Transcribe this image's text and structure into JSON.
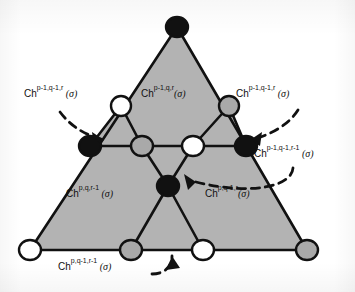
{
  "figure": {
    "colors": {
      "face_fill": "#b3b3b3",
      "line": "#111111",
      "vertex_black": "#111111",
      "vertex_white": "#ffffff",
      "vertex_gray": "#a9a9a9",
      "background": "#ffffff",
      "arrow": "#111111"
    },
    "labels": [
      {
        "id": "label-top-left",
        "prefix": "Ch",
        "superscript": "p-1,q-1,r",
        "arg": " (σ)",
        "x": 24,
        "y": 88
      },
      {
        "id": "label-top-center",
        "prefix": "Ch",
        "superscript": "p-1,q,r",
        "arg": "(σ)",
        "x": 141,
        "y": 88
      },
      {
        "id": "label-top-right",
        "prefix": "Ch",
        "superscript": "p-1,q-1,r",
        "arg": " (σ)",
        "x": 236,
        "y": 88
      },
      {
        "id": "label-right-middle",
        "prefix": "Ch",
        "superscript": "p-1,q-1,r-1",
        "arg": " (σ)",
        "x": 254,
        "y": 148
      },
      {
        "id": "label-lower-left",
        "prefix": "Ch",
        "superscript": "p,q,r-1",
        "arg": " (σ)",
        "x": 66,
        "y": 188
      },
      {
        "id": "label-lower-right",
        "prefix": "Ch",
        "superscript": "p,q-1,r",
        "arg": "(σ)",
        "x": 205,
        "y": 188
      },
      {
        "id": "label-bottom",
        "prefix": "Ch",
        "superscript": "p,q-1,r-1",
        "arg": " (σ)",
        "x": 58,
        "y": 261
      }
    ],
    "vertices": [
      {
        "id": "vertex-apex",
        "x": 177,
        "y": 27,
        "fill": "black",
        "rx": 11,
        "ry": 10
      },
      {
        "id": "vertex-upper-left",
        "x": 121,
        "y": 106,
        "fill": "white",
        "rx": 10,
        "ry": 10
      },
      {
        "id": "vertex-upper-right",
        "x": 229,
        "y": 106,
        "fill": "gray",
        "rx": 10,
        "ry": 10
      },
      {
        "id": "vertex-mid-left",
        "x": 90,
        "y": 146,
        "fill": "black",
        "rx": 11,
        "ry": 10
      },
      {
        "id": "vertex-mid-cl",
        "x": 142,
        "y": 146,
        "fill": "gray",
        "rx": 11,
        "ry": 10
      },
      {
        "id": "vertex-mid-cr",
        "x": 193,
        "y": 146,
        "fill": "white",
        "rx": 11,
        "ry": 10
      },
      {
        "id": "vertex-mid-right",
        "x": 246,
        "y": 146,
        "fill": "black",
        "rx": 11,
        "ry": 10
      },
      {
        "id": "vertex-center",
        "x": 168,
        "y": 186,
        "fill": "black",
        "rx": 11,
        "ry": 10
      },
      {
        "id": "vertex-bottom-left",
        "x": 30,
        "y": 250,
        "fill": "white",
        "rx": 11,
        "ry": 10
      },
      {
        "id": "vertex-bottom-cl",
        "x": 131,
        "y": 250,
        "fill": "gray",
        "rx": 11,
        "ry": 10
      },
      {
        "id": "vertex-bottom-cr",
        "x": 203,
        "y": 250,
        "fill": "white",
        "rx": 11,
        "ry": 10
      },
      {
        "id": "vertex-bottom-right",
        "x": 307,
        "y": 250,
        "fill": "gray",
        "rx": 11,
        "ry": 10
      }
    ],
    "arrows": [
      {
        "id": "arrow-top-left",
        "target": "vertex-mid-left"
      },
      {
        "id": "arrow-top-right",
        "target": "vertex-upper-right-edge"
      },
      {
        "id": "arrow-right",
        "target": "vertex-center"
      },
      {
        "id": "arrow-bottom",
        "target": "bottom-edge"
      }
    ]
  }
}
